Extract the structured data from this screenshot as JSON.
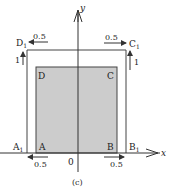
{
  "figure": {
    "caption": "(c)",
    "axes": {
      "x_label": "x",
      "y_label": "y",
      "origin_label": "0"
    },
    "outer_rect": {
      "corners": [
        "A1",
        "B1",
        "C1",
        "D1"
      ]
    },
    "inner_rect": {
      "corners": [
        "A",
        "B",
        "C",
        "D"
      ],
      "fill": "#cccccc"
    },
    "labels": {
      "A": "A",
      "B": "B",
      "C": "C",
      "D": "D",
      "A1": "A",
      "A1_sub": "1",
      "B1": "B",
      "B1_sub": "1",
      "C1": "C",
      "C1_sub": "1",
      "D1": "D",
      "D1_sub": "1"
    },
    "displacements": {
      "D1_horizontal": "0.5",
      "D1_vertical": "1",
      "C1_horizontal": "0.5",
      "C1_vertical": "1",
      "A_horizontal": "0.5",
      "B_horizontal": "0.5"
    },
    "colors": {
      "line": "#333333",
      "fill": "#cccccc"
    }
  }
}
